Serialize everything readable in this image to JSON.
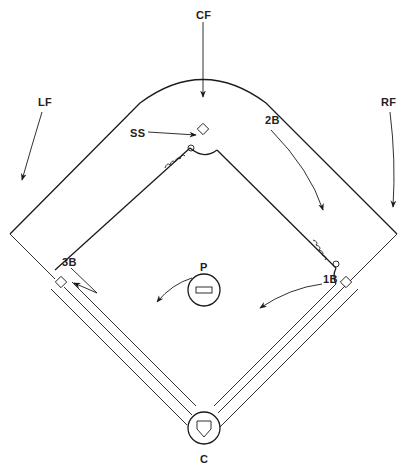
{
  "labels": {
    "cf": "CF",
    "lf": "LF",
    "rf": "RF",
    "ss": "SS",
    "second_base": "2B",
    "third_base": "3B",
    "first_base": "1B",
    "pitcher": "P",
    "catcher": "C"
  },
  "colors": {
    "ink": "#1a1a1a",
    "background": "#ffffff"
  }
}
